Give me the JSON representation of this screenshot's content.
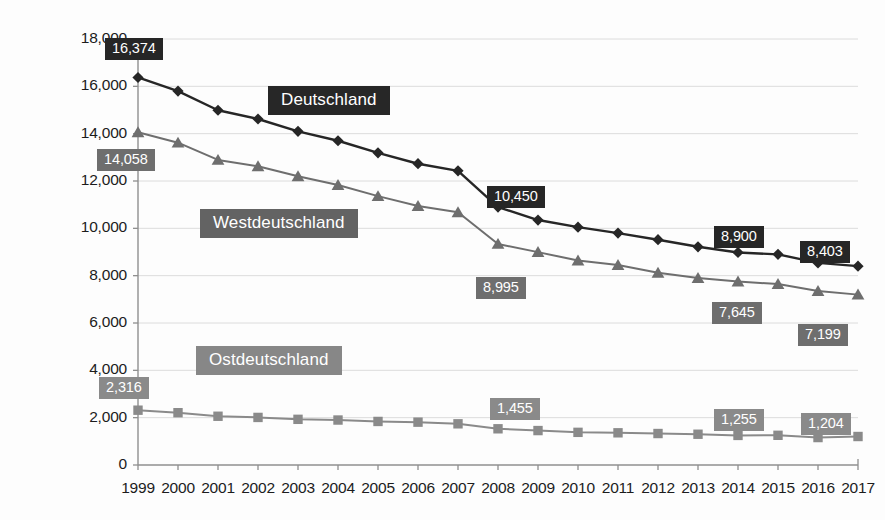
{
  "chart_data": {
    "type": "line",
    "title": "",
    "subtitle": "",
    "xlabel": "",
    "ylabel": "",
    "grid": true,
    "legend_position": "inline-labels",
    "categories": [
      "1999",
      "2000",
      "2001",
      "2002",
      "2003",
      "2004",
      "2005",
      "2006",
      "2007",
      "2008",
      "2009",
      "2010",
      "2011",
      "2012",
      "2013",
      "2014",
      "2015",
      "2016",
      "2017"
    ],
    "x": [
      1999,
      2000,
      2001,
      2002,
      2003,
      2004,
      2005,
      2006,
      2007,
      2008,
      2009,
      2010,
      2011,
      2012,
      2013,
      2014,
      2015,
      2016,
      2017
    ],
    "ylim": [
      0,
      18000
    ],
    "ytick_values": [
      0,
      2000,
      4000,
      6000,
      8000,
      10000,
      12000,
      14000,
      16000,
      18000
    ],
    "ytick_labels": [
      "0",
      "2,000",
      "4,000",
      "6,000",
      "8,000",
      "10,000",
      "12,000",
      "14,000",
      "16,000",
      "18,000"
    ],
    "series": [
      {
        "name": "Deutschland",
        "marker": "diamond",
        "color": "#262626",
        "values": [
          16374,
          15800,
          14990,
          14620,
          14100,
          13700,
          13190,
          12730,
          12430,
          10900,
          10350,
          10050,
          9800,
          9520,
          9220,
          8980,
          8900,
          8540,
          8403
        ]
      },
      {
        "name": "Westdeutschland",
        "marker": "triangle",
        "color": "#6e6e6e",
        "values": [
          14058,
          13620,
          12890,
          12620,
          12200,
          11830,
          11360,
          10940,
          10680,
          9340,
          8995,
          8640,
          8450,
          8120,
          7900,
          7750,
          7645,
          7350,
          7199
        ]
      },
      {
        "name": "Ostdeutschland",
        "marker": "square",
        "color": "#8a8a8a",
        "values": [
          2316,
          2210,
          2060,
          2010,
          1930,
          1900,
          1840,
          1810,
          1740,
          1530,
          1455,
          1380,
          1360,
          1330,
          1300,
          1250,
          1255,
          1160,
          1204
        ]
      }
    ],
    "point_labels": [
      {
        "series": "Deutschland",
        "series_index": 0,
        "year": "1999",
        "value": 16374,
        "text": "16,374",
        "box_x": 105,
        "box_y": 38
      },
      {
        "series": "Deutschland",
        "series_index": 0,
        "year": "2009",
        "value": 10450,
        "text": "10,450",
        "box_x": 487,
        "box_y": 186
      },
      {
        "series": "Deutschland",
        "series_index": 0,
        "year": "2015",
        "value": 8900,
        "text": "8,900",
        "box_x": 714,
        "box_y": 226
      },
      {
        "series": "Deutschland",
        "series_index": 0,
        "year": "2017",
        "value": 8403,
        "text": "8,403",
        "box_x": 800,
        "box_y": 241
      },
      {
        "series": "Westdeutschland",
        "series_index": 1,
        "year": "1999",
        "value": 14058,
        "text": "14,058",
        "box_x": 97,
        "box_y": 149
      },
      {
        "series": "Westdeutschland",
        "series_index": 1,
        "year": "2009",
        "value": 8995,
        "text": "8,995",
        "box_x": 476,
        "box_y": 277
      },
      {
        "series": "Westdeutschland",
        "series_index": 1,
        "year": "2015",
        "value": 7645,
        "text": "7,645",
        "box_x": 712,
        "box_y": 302
      },
      {
        "series": "Westdeutschland",
        "series_index": 1,
        "year": "2017",
        "value": 7199,
        "text": "7,199",
        "box_x": 798,
        "box_y": 324
      },
      {
        "series": "Ostdeutschland",
        "series_index": 2,
        "year": "1999",
        "value": 2316,
        "text": "2,316",
        "box_x": 99,
        "box_y": 377
      },
      {
        "series": "Ostdeutschland",
        "series_index": 2,
        "year": "2009",
        "value": 1455,
        "text": "1,455",
        "box_x": 490,
        "box_y": 398
      },
      {
        "series": "Ostdeutschland",
        "series_index": 2,
        "year": "2015",
        "value": 1255,
        "text": "1,255",
        "box_x": 714,
        "box_y": 409
      },
      {
        "series": "Ostdeutschland",
        "series_index": 2,
        "year": "2017",
        "value": 1204,
        "text": "1,204",
        "box_x": 801,
        "box_y": 413
      }
    ],
    "series_annotations": [
      {
        "text": "Deutschland",
        "series_index": 0,
        "box_x": 268,
        "box_y": 86
      },
      {
        "text": "Westdeutschland",
        "series_index": 1,
        "box_x": 200,
        "box_y": 209
      },
      {
        "text": "Ostdeutschland",
        "series_index": 2,
        "box_x": 196,
        "box_y": 346
      }
    ]
  },
  "axis": {
    "axis_line_color": "#8f8f8f",
    "grid_color": "#dcdcdc"
  }
}
